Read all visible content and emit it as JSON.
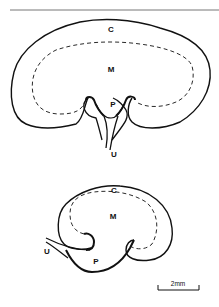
{
  "figure": {
    "top_kidney": {
      "labels": {
        "cortex": "C",
        "medulla": "M",
        "pelvis": "P",
        "ureter": "U"
      }
    },
    "bottom_kidney": {
      "labels": {
        "cortex": "C",
        "medulla": "M",
        "pelvis": "P",
        "ureter": "U"
      }
    },
    "scale_bar": {
      "label": "2mm"
    },
    "colors": {
      "line": "#111111",
      "rule": "#777777",
      "background": "#ffffff"
    }
  }
}
